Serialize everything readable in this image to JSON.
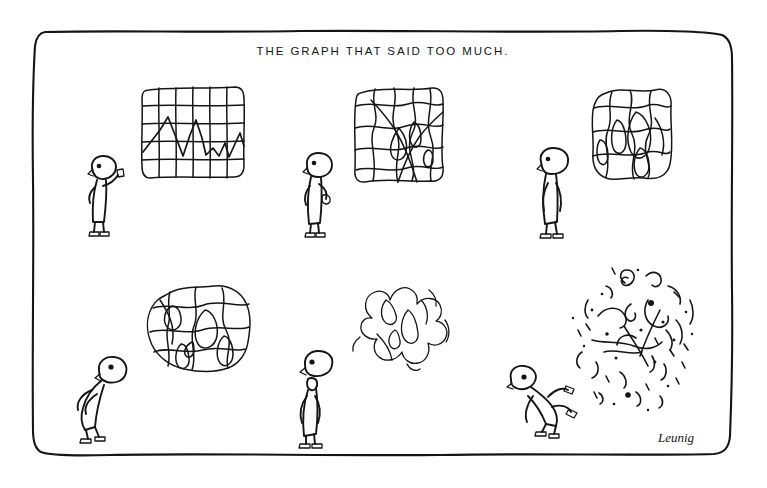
{
  "cartoon": {
    "title": "THE GRAPH THAT SAID TOO MUCH.",
    "signature": "Leunig",
    "medium": "pen-and-ink single-panel cartoon",
    "background_color": "#ffffff",
    "ink_color": "#151515",
    "frame": {
      "name": "hand-drawn-border",
      "style": "wobbly rounded rectangle",
      "x": 33,
      "y": 31,
      "width": 700,
      "height": 424
    },
    "panels": [
      {
        "index": 1,
        "row": 1,
        "column": 1,
        "graph_label": "orderly-grid-graph",
        "graph_state": "A neat rectangular grid chart with a sharp zigzag line plotted across it",
        "figure_label": "man-pointing",
        "figure_state": "Small bespectacled man standing upright, one hand raised pointing at the graph"
      },
      {
        "index": 2,
        "row": 1,
        "column": 2,
        "graph_label": "warping-grid-graph",
        "graph_state": "The grid has begun to buckle; lines bend into loops and the data line dissolves into the mesh",
        "figure_label": "man-puzzled",
        "figure_state": "Man lowers his hand and leans in, puzzled"
      },
      {
        "index": 3,
        "row": 1,
        "column": 3,
        "graph_label": "melting-grid-graph",
        "graph_state": "Grid edges round off and the cells melt into irregular lobes",
        "figure_label": "man-head-back",
        "figure_state": "Man tilts his head back, arms hanging, bewildered"
      },
      {
        "index": 4,
        "row": 2,
        "column": 1,
        "graph_label": "blob-graph",
        "graph_state": "The graph has become a round amoeba-like blob of tangled closed loops",
        "figure_label": "man-craning-forward",
        "figure_state": "Man hunches forward, head craned out, peering closely"
      },
      {
        "index": 5,
        "row": 2,
        "column": 2,
        "graph_label": "unravelling-cloud-graph",
        "graph_state": "The blob unravels into a loose drifting cloud of soft squiggles",
        "figure_label": "man-slack-jawed",
        "figure_state": "Man stands stiff with his mouth hanging open in astonishment"
      },
      {
        "index": 6,
        "row": 2,
        "column": 3,
        "graph_label": "exploded-fragments-graph",
        "graph_state": "The graph has detonated into scattered specks, dots and broken fragments of line",
        "figure_label": "man-knocked-over",
        "figure_state": "Man is blown off his feet, tumbling backwards with legs in the air"
      }
    ]
  }
}
